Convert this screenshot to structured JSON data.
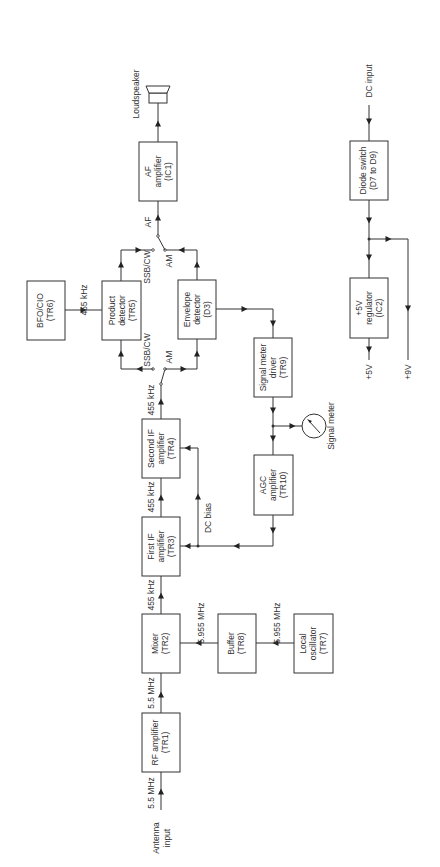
{
  "diagram": {
    "orientation": "rotated 90 degrees counter-clockwise",
    "blocks": {
      "rf_amp": {
        "line1": "RF amplifier",
        "line2": "(TR1)"
      },
      "mixer": {
        "line1": "Mixer",
        "line2": "(TR2)"
      },
      "first_if": {
        "line1": "First IF",
        "line2": "amplifier",
        "line3": "(TR3)"
      },
      "second_if": {
        "line1": "Second IF",
        "line2": "amplifier",
        "line3": "(TR4)"
      },
      "product_det": {
        "line1": "Product",
        "line2": "detector",
        "line3": "(TR5)"
      },
      "bfo": {
        "line1": "BFO/CIO",
        "line2": "(TR6)"
      },
      "envelope_det": {
        "line1": "Envelope",
        "line2": "detector",
        "line3": "(D3)"
      },
      "af_amp": {
        "line1": "AF",
        "line2": "amplifier",
        "line3": "(IC1)"
      },
      "buffer": {
        "line1": "Buffer",
        "line2": "(TR8)"
      },
      "local_osc": {
        "line1": "Local",
        "line2": "oscillator",
        "line3": "(TR7)"
      },
      "sig_meter_driver": {
        "line1": "Signal meter",
        "line2": "driver",
        "line3": "(TR9)"
      },
      "agc_amp": {
        "line1": "AGC",
        "line2": "amplifier",
        "line3": "(TR10)"
      },
      "diode_switch": {
        "line1": "Diode switch",
        "line2": "(D7 to D9)"
      },
      "regulator": {
        "line1": "+5V",
        "line2": "regulator",
        "line3": "(IC2)"
      }
    },
    "labels": {
      "antenna_l1": "Antenna",
      "antenna_l2": "input",
      "f_ant": "5.5 MHz",
      "f_rf": "5.5 MHz",
      "f_mix": "455 kHz",
      "f_if1": "455 kHz",
      "f_if2": "455 kHz",
      "f_bfo": "455 kHz",
      "f_buf": "5.955 MHz",
      "f_lo": "5.955 MHz",
      "dc_bias": "DC bias",
      "ssb_in": "SSB/CW",
      "am_in": "AM",
      "ssb_out": "SSB/CW",
      "am_out": "AM",
      "af": "AF",
      "loudspeaker": "Loudspeaker",
      "signal_meter": "Signal meter",
      "dc_input": "DC input",
      "plus5v": "+5V",
      "plus9v": "+9V"
    },
    "icons": [
      "loudspeaker-icon",
      "signal-meter-icon"
    ]
  }
}
